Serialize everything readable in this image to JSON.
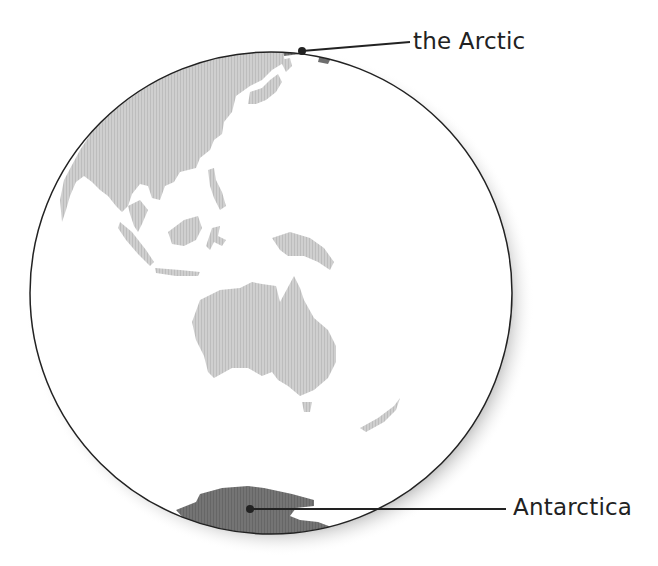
{
  "diagram": {
    "type": "globe-map",
    "view": "Asia-Pacific hemisphere",
    "labels": [
      {
        "id": "arctic",
        "text": "the Arctic"
      },
      {
        "id": "antarctica",
        "text": "Antarctica"
      }
    ],
    "colors": {
      "land": "#c8c8c8",
      "highlight": "#6e6e6e",
      "outline": "#222222",
      "ocean": "#ffffff"
    }
  }
}
